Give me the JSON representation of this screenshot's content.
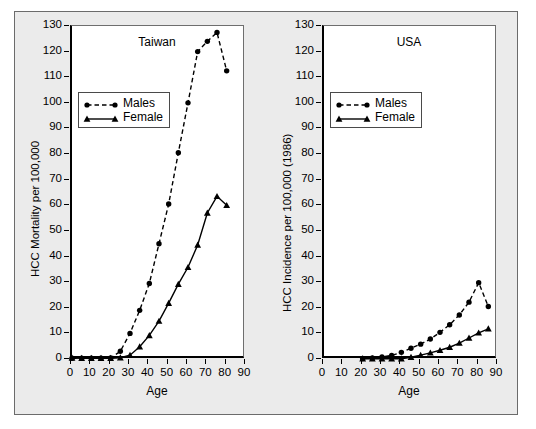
{
  "figure": {
    "background": "#ebebeb",
    "border_color": "#6b6b6b",
    "axis_color": "#000000",
    "series_color": "#000000"
  },
  "chart_data": [
    {
      "type": "line",
      "title": "Taiwan",
      "xlabel": "Age",
      "ylabel": "HCC Mortality per 100,000",
      "xlim": [
        0,
        90
      ],
      "ylim": [
        0,
        130
      ],
      "xticks": [
        0,
        10,
        20,
        30,
        40,
        50,
        60,
        70,
        80,
        90
      ],
      "yticks": [
        0,
        10,
        20,
        30,
        40,
        50,
        60,
        70,
        80,
        90,
        100,
        110,
        120,
        130
      ],
      "grid": false,
      "legend_position": "upper-left",
      "series": [
        {
          "name": "Males",
          "marker": "circle",
          "linestyle": "dashed",
          "x": [
            0,
            5,
            10,
            15,
            20,
            25,
            30,
            35,
            40,
            45,
            50,
            55,
            60,
            65,
            70,
            75,
            80
          ],
          "values": [
            0.3,
            0.3,
            0.3,
            0.3,
            0.4,
            3.0,
            10.0,
            19.0,
            29.5,
            45.0,
            60.5,
            80.5,
            100.0,
            120.0,
            124.0,
            127.5,
            112.5
          ]
        },
        {
          "name": "Female",
          "marker": "triangle",
          "linestyle": "solid",
          "x": [
            0,
            5,
            10,
            15,
            20,
            25,
            30,
            35,
            40,
            45,
            50,
            55,
            60,
            65,
            70,
            75,
            80
          ],
          "values": [
            0.4,
            0.3,
            0.3,
            0.3,
            0.3,
            0.5,
            1.5,
            4.8,
            9.2,
            14.8,
            21.8,
            29.2,
            35.8,
            44.5,
            57.0,
            63.5,
            60.0
          ]
        }
      ]
    },
    {
      "type": "line",
      "title": "USA",
      "xlabel": "Age",
      "ylabel": "HCC Incidence per 100,000 (1986)",
      "xlim": [
        0,
        90
      ],
      "ylim": [
        0,
        130
      ],
      "xticks": [
        0,
        10,
        20,
        30,
        40,
        50,
        60,
        70,
        80,
        90
      ],
      "yticks": [
        0,
        10,
        20,
        30,
        40,
        50,
        60,
        70,
        80,
        90,
        100,
        110,
        120,
        130
      ],
      "grid": false,
      "legend_position": "upper-left",
      "series": [
        {
          "name": "Males",
          "marker": "circle",
          "linestyle": "dashed",
          "x": [
            20,
            25,
            30,
            35,
            40,
            45,
            50,
            55,
            60,
            65,
            70,
            75,
            80,
            85
          ],
          "values": [
            0.2,
            0.4,
            0.8,
            1.4,
            2.6,
            4.2,
            5.8,
            7.8,
            10.4,
            13.4,
            17.2,
            22.2,
            29.8,
            20.5
          ]
        },
        {
          "name": "Female",
          "marker": "triangle",
          "linestyle": "solid",
          "x": [
            20,
            25,
            30,
            35,
            40,
            45,
            50,
            55,
            60,
            65,
            70,
            75,
            80,
            85
          ],
          "values": [
            0.1,
            0.1,
            0.1,
            0.1,
            0.1,
            0.7,
            1.5,
            2.4,
            3.4,
            4.6,
            6.2,
            8.2,
            10.2,
            11.8
          ]
        }
      ]
    }
  ],
  "panels": [
    {
      "id": "taiwan",
      "title": "Taiwan",
      "ylabel": "HCC Mortality per 100,000",
      "xlabel": "Age",
      "legend": [
        {
          "label": "Males",
          "marker": "circle",
          "linestyle": "dashed"
        },
        {
          "label": "Female",
          "marker": "triangle",
          "linestyle": "solid"
        }
      ]
    },
    {
      "id": "usa",
      "title": "USA",
      "ylabel": "HCC Incidence per 100,000 (1986)",
      "xlabel": "Age",
      "legend": [
        {
          "label": "Males",
          "marker": "circle",
          "linestyle": "dashed"
        },
        {
          "label": "Female",
          "marker": "triangle",
          "linestyle": "solid"
        }
      ]
    }
  ]
}
